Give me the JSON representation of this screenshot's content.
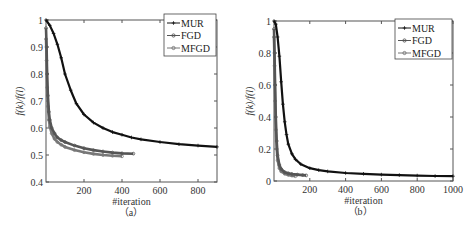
{
  "figure": {
    "panels": [
      "(a)",
      "(b)"
    ]
  },
  "chart_data": [
    {
      "type": "line",
      "title": "",
      "caption": "（a）",
      "xlabel": "#iteration",
      "ylabel": "f(k)/f(l)",
      "xlim": [
        0,
        900
      ],
      "ylim": [
        0.4,
        1.0
      ],
      "xticks": [
        200,
        400,
        600,
        800
      ],
      "yticks": [
        0.4,
        0.5,
        0.6,
        0.7,
        0.8,
        0.9,
        1.0
      ],
      "ytick_labels": [
        "0.4",
        "0.5",
        "0.6",
        "0.7",
        "0.8",
        "0.9",
        "1"
      ],
      "grid": false,
      "legend_position": "upper right",
      "series": [
        {
          "name": "MUR",
          "color": "#111111",
          "x": [
            0,
            20,
            40,
            60,
            80,
            100,
            130,
            160,
            200,
            250,
            300,
            350,
            400,
            450,
            500,
            600,
            700,
            800,
            900
          ],
          "y": [
            1.0,
            0.98,
            0.95,
            0.91,
            0.86,
            0.8,
            0.74,
            0.69,
            0.65,
            0.62,
            0.6,
            0.585,
            0.575,
            0.565,
            0.558,
            0.548,
            0.54,
            0.535,
            0.53
          ]
        },
        {
          "name": "FGD",
          "color": "#555555",
          "x": [
            0,
            3,
            6,
            10,
            15,
            20,
            30,
            45,
            60,
            80,
            100,
            150,
            200,
            250,
            300,
            350,
            400,
            460
          ],
          "y": [
            0.97,
            0.9,
            0.8,
            0.72,
            0.66,
            0.63,
            0.6,
            0.58,
            0.565,
            0.555,
            0.548,
            0.535,
            0.525,
            0.518,
            0.513,
            0.509,
            0.506,
            0.505
          ]
        },
        {
          "name": "MFGD",
          "color": "#777777",
          "x": [
            0,
            3,
            6,
            10,
            15,
            20,
            30,
            45,
            60,
            80,
            100,
            150,
            200,
            250,
            300,
            350,
            400
          ],
          "y": [
            0.93,
            0.85,
            0.75,
            0.68,
            0.63,
            0.605,
            0.58,
            0.56,
            0.548,
            0.538,
            0.53,
            0.518,
            0.51,
            0.504,
            0.5,
            0.497,
            0.495
          ]
        }
      ]
    },
    {
      "type": "line",
      "title": "",
      "caption": "（b）",
      "xlabel": "#iteration",
      "ylabel": "f(k)/f(l)",
      "xlim": [
        0,
        1000
      ],
      "ylim": [
        0,
        1.0
      ],
      "xticks": [
        200,
        400,
        600,
        800,
        1000
      ],
      "yticks": [
        0,
        0.2,
        0.4,
        0.6,
        0.8,
        1.0
      ],
      "ytick_labels": [
        "0",
        "0.2",
        "0.4",
        "0.6",
        "0.8",
        "1"
      ],
      "grid": false,
      "legend_position": "upper right",
      "series": [
        {
          "name": "MUR",
          "color": "#111111",
          "x": [
            0,
            10,
            20,
            30,
            40,
            50,
            60,
            70,
            80,
            100,
            120,
            150,
            200,
            250,
            300,
            400,
            500,
            600,
            700,
            800,
            900,
            1000
          ],
          "y": [
            1.0,
            0.98,
            0.9,
            0.78,
            0.62,
            0.48,
            0.37,
            0.29,
            0.23,
            0.17,
            0.135,
            0.105,
            0.08,
            0.068,
            0.06,
            0.05,
            0.045,
            0.04,
            0.037,
            0.034,
            0.031,
            0.03
          ]
        },
        {
          "name": "FGD",
          "color": "#555555",
          "x": [
            0,
            3,
            6,
            10,
            15,
            20,
            30,
            40,
            60,
            80,
            100,
            130,
            160,
            180
          ],
          "y": [
            0.95,
            0.8,
            0.6,
            0.4,
            0.25,
            0.16,
            0.1,
            0.075,
            0.055,
            0.048,
            0.044,
            0.04,
            0.037,
            0.035
          ]
        },
        {
          "name": "MFGD",
          "color": "#777777",
          "x": [
            0,
            3,
            6,
            10,
            15,
            20,
            30,
            40,
            60,
            80,
            100,
            120
          ],
          "y": [
            0.9,
            0.72,
            0.5,
            0.32,
            0.2,
            0.13,
            0.08,
            0.06,
            0.045,
            0.038,
            0.034,
            0.03
          ]
        }
      ]
    }
  ]
}
